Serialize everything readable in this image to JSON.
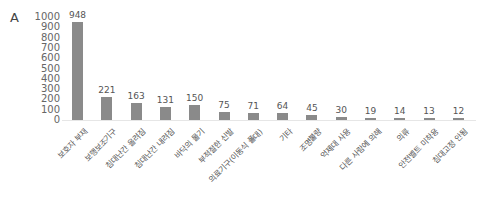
{
  "panel_label": "A",
  "chart_data": {
    "type": "bar",
    "title": "",
    "xlabel": "",
    "ylabel": "",
    "ylim": [
      0,
      1000
    ],
    "yticks": [
      0,
      100,
      200,
      300,
      400,
      500,
      600,
      700,
      800,
      900,
      1000
    ],
    "grid": false,
    "legend": null,
    "bar_color": "#8a8a8a",
    "categories": [
      "보호자 부재",
      "보행보조기구",
      "침대난간 올려짐",
      "침대난간 내려짐",
      "바닥의 물기",
      "부적절한 신발",
      "의료기구(이동식 폴대)",
      "기타",
      "조명불량",
      "억제대 사용",
      "다른 사람에 의해",
      "의류",
      "안전벨트 미착용",
      "침대고정 안됨"
    ],
    "values": [
      948,
      221,
      163,
      131,
      150,
      75,
      71,
      64,
      45,
      30,
      19,
      14,
      13,
      12
    ]
  }
}
